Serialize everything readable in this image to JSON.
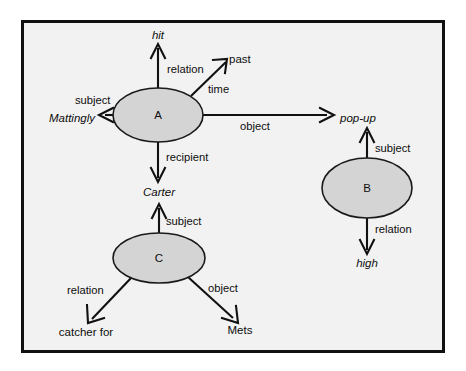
{
  "figure": {
    "type": "semantic-network-diagram",
    "background_color": "#f2f2f2",
    "border_color": "#111111",
    "node_fill_color": "#d4d4d4",
    "node_stroke_color": "#1a1a1a",
    "edge_color": "#111111"
  },
  "nodes": [
    {
      "id": "A",
      "label": "A",
      "cx": 158,
      "cy": 115,
      "rx": 45,
      "ry": 27
    },
    {
      "id": "B",
      "label": "B",
      "cx": 367,
      "cy": 188,
      "rx": 45,
      "ry": 30
    },
    {
      "id": "C",
      "label": "C",
      "cx": 159,
      "cy": 258,
      "rx": 46,
      "ry": 25
    }
  ],
  "entities": [
    {
      "id": "hit",
      "label": "hit",
      "style": "italic",
      "x": 158,
      "y": 39,
      "anchor": "middle"
    },
    {
      "id": "past",
      "label": "past",
      "style": "normal",
      "x": 229,
      "y": 63,
      "anchor": "start"
    },
    {
      "id": "mattingly",
      "label": "Mattingly",
      "style": "italic",
      "x": 95,
      "y": 122,
      "anchor": "end"
    },
    {
      "id": "popup",
      "label": "pop-up",
      "style": "italic",
      "x": 340,
      "y": 122,
      "anchor": "start"
    },
    {
      "id": "carter",
      "label": "Carter",
      "style": "italic",
      "x": 159,
      "y": 196,
      "anchor": "middle"
    },
    {
      "id": "high",
      "label": "high",
      "style": "italic",
      "x": 367,
      "y": 267,
      "anchor": "middle"
    },
    {
      "id": "catcher_for",
      "label": "catcher for",
      "style": "normal",
      "x": 86,
      "y": 336,
      "anchor": "middle"
    },
    {
      "id": "mets",
      "label": "Mets",
      "style": "normal",
      "x": 240,
      "y": 334,
      "anchor": "middle"
    }
  ],
  "edges": [
    {
      "id": "a-hit",
      "from": "A",
      "to": "hit",
      "label": "relation",
      "label_x": 167,
      "label_y": 73,
      "anchor": "start"
    },
    {
      "id": "a-past",
      "from": "A",
      "to": "past",
      "label": "time",
      "label_x": 208,
      "label_y": 93,
      "anchor": "start"
    },
    {
      "id": "a-mattingly",
      "from": "A",
      "to": "mattingly",
      "label": "subject",
      "label_x": 75,
      "label_y": 104,
      "anchor": "start"
    },
    {
      "id": "a-popup",
      "from": "A",
      "to": "popup",
      "label": "object",
      "label_x": 240,
      "label_y": 130,
      "anchor": "start"
    },
    {
      "id": "a-carter",
      "from": "A",
      "to": "carter",
      "label": "recipient",
      "label_x": 166,
      "label_y": 161,
      "anchor": "start"
    },
    {
      "id": "b-popup",
      "from": "B",
      "to": "popup",
      "label": "subject",
      "label_x": 375,
      "label_y": 152,
      "anchor": "start"
    },
    {
      "id": "b-high",
      "from": "B",
      "to": "high",
      "label": "relation",
      "label_x": 375,
      "label_y": 233,
      "anchor": "start"
    },
    {
      "id": "c-carter",
      "from": "C",
      "to": "carter",
      "label": "subject",
      "label_x": 166,
      "label_y": 225,
      "anchor": "start"
    },
    {
      "id": "c-catcher",
      "from": "C",
      "to": "catcher_for",
      "label": "relation",
      "label_x": 67,
      "label_y": 294,
      "anchor": "start"
    },
    {
      "id": "c-mets",
      "from": "C",
      "to": "mets",
      "label": "object",
      "label_x": 208,
      "label_y": 292,
      "anchor": "start"
    }
  ],
  "caption": ""
}
